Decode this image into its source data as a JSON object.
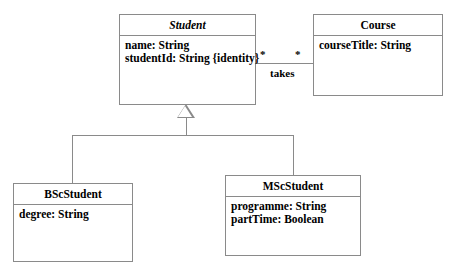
{
  "diagram": {
    "background_color": "#ffffff",
    "line_color": "#8a8a8a",
    "text_color": "#000000"
  },
  "classes": {
    "student": {
      "name": "Student",
      "abstract": true,
      "attributes": [
        "name: String",
        "studentId: String {identity}"
      ]
    },
    "course": {
      "name": "Course",
      "abstract": false,
      "attributes": [
        "courseTitle: String"
      ]
    },
    "bsc_student": {
      "name": "BScStudent",
      "abstract": false,
      "attributes": [
        "degree: String"
      ]
    },
    "msc_student": {
      "name": "MScStudent",
      "abstract": false,
      "attributes": [
        "programme: String",
        "partTime: Boolean"
      ]
    }
  },
  "associations": {
    "takes": {
      "label": "takes",
      "source_multiplicity": "*",
      "target_multiplicity": "*"
    }
  },
  "generalizations": {
    "label": "",
    "parent": "Student",
    "children": [
      "BScStudent",
      "MScStudent"
    ]
  }
}
